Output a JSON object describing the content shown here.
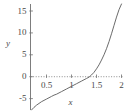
{
  "chart_data": {
    "type": "line",
    "title": "",
    "xlabel": "x",
    "ylabel": "y",
    "xlim": [
      0.18,
      2.05
    ],
    "ylim": [
      -7.6,
      16.6
    ],
    "grid": false,
    "legend": null,
    "axis_style": "dotted-x-axis-solid-y-axis",
    "x_ticks": [
      {
        "value": 0.5,
        "label": "0.5"
      },
      {
        "value": 1.0,
        "label": "1"
      },
      {
        "value": 1.5,
        "label": "1.5"
      },
      {
        "value": 2.0,
        "label": "2"
      }
    ],
    "y_ticks": [
      {
        "value": 15,
        "label": "15"
      },
      {
        "value": 10,
        "label": "10"
      },
      {
        "value": 5,
        "label": "5"
      },
      {
        "value": 0,
        "label": "0"
      },
      {
        "value": -5,
        "label": "-5"
      }
    ],
    "zero_crossing_x": 1.4,
    "series": [
      {
        "name": "curve",
        "color": "#5a5a5a",
        "x": [
          0.2,
          0.25,
          0.3,
          0.35,
          0.4,
          0.45,
          0.5,
          0.55,
          0.6,
          0.65,
          0.7,
          0.75,
          0.8,
          0.85,
          0.9,
          0.95,
          1.0,
          1.05,
          1.1,
          1.15,
          1.2,
          1.25,
          1.3,
          1.35,
          1.4,
          1.45,
          1.5,
          1.55,
          1.6,
          1.65,
          1.7,
          1.75,
          1.8,
          1.85,
          1.9,
          1.95,
          2.0
        ],
        "y": [
          -7.6,
          -7.0,
          -6.5,
          -6.1,
          -5.7,
          -5.4,
          -5.1,
          -4.8,
          -4.5,
          -4.2,
          -4.0,
          -3.7,
          -3.4,
          -3.1,
          -2.8,
          -2.5,
          -2.2,
          -1.9,
          -1.6,
          -1.3,
          -1.0,
          -0.7,
          -0.4,
          -0.1,
          0.4,
          1.0,
          1.8,
          2.7,
          3.8,
          5.0,
          6.4,
          8.0,
          9.8,
          11.7,
          13.6,
          15.3,
          16.6
        ]
      }
    ]
  }
}
